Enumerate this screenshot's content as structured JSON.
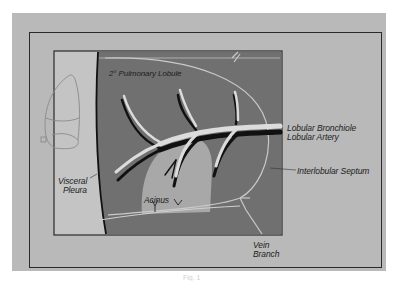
{
  "figure": {
    "title_label": "2° Pulmonary Lobule",
    "labels": {
      "lobular_bronchiole": "Lobular Bronchiole",
      "lobular_artery": "Lobular Artery",
      "interlobular_septum": "Interlobular Septum",
      "visceral_pleura_line1": "Visceral",
      "visceral_pleura_line2": "Pleura",
      "acinus": "Acinus",
      "vein_line1": "Vein",
      "vein_line2": "Branch"
    },
    "caption": "Fig. 1",
    "colors": {
      "mat": "#b9b9b9",
      "lobule_fill": "#707070",
      "pleura_strip": "#c4c4c4",
      "acinus_fill": "#a8a8a8",
      "bronchiole": "#dcdcdc",
      "artery": "#111111",
      "frame": "#2a2a2a"
    }
  }
}
